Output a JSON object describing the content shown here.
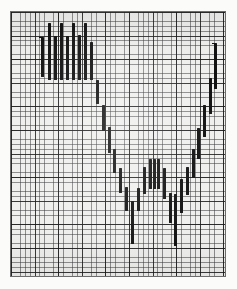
{
  "figure": {
    "kind": "graph-paper-bar-chart",
    "background_color": "#fbfbfa",
    "plot_background_color": "#efefee",
    "bar_color": "#111111",
    "grid_minor_color": "#3c3c3c",
    "grid_major_color": "#191919",
    "plot_left": 10,
    "plot_top": 11,
    "plot_width": 216,
    "plot_height": 266,
    "grid_minor_step_px": 4.72,
    "grid_major_step_px": 23.6,
    "grid_minor_cols": 45,
    "grid_minor_rows": 56
  },
  "chart_data": {
    "type": "bar",
    "title": "",
    "subtitle": "",
    "xlabel": "",
    "ylabel": "",
    "legend": [],
    "grid": true,
    "legend_position": "none",
    "orientation": "vertical",
    "note": "Vertical price bars (high-low range bars) on graph paper forming a V / U shaped pattern: a high plateau at left, a decline to a low trough in the centre, then a recovery back up to the right.",
    "x_unit": "bar index",
    "y_unit": "grid squares from bottom",
    "xlim": [
      0,
      45
    ],
    "ylim": [
      0,
      56
    ],
    "categories": [
      "1",
      "2",
      "3",
      "4",
      "5",
      "6",
      "7",
      "8",
      "9",
      "10",
      "11",
      "12",
      "13",
      "14",
      "15",
      "16",
      "17",
      "18",
      "19",
      "20",
      "21",
      "22",
      "23",
      "24",
      "25",
      "26",
      "27",
      "28",
      "29",
      "30",
      "31",
      "32",
      "33",
      "34",
      "35",
      "36"
    ],
    "bars": [
      {
        "index": 1,
        "x_px": 40,
        "top_px": 36,
        "bottom_px": 76,
        "high": 49,
        "low": 41
      },
      {
        "index": 2,
        "x_px": 47,
        "top_px": 22,
        "bottom_px": 79,
        "high": 52,
        "low": 40
      },
      {
        "index": 3,
        "x_px": 53,
        "top_px": 35,
        "bottom_px": 79,
        "high": 49,
        "low": 40
      },
      {
        "index": 4,
        "x_px": 59,
        "top_px": 22,
        "bottom_px": 79,
        "high": 52,
        "low": 40
      },
      {
        "index": 5,
        "x_px": 65,
        "top_px": 35,
        "bottom_px": 79,
        "high": 49,
        "low": 40
      },
      {
        "index": 6,
        "x_px": 71,
        "top_px": 22,
        "bottom_px": 79,
        "high": 52,
        "low": 40
      },
      {
        "index": 7,
        "x_px": 77,
        "top_px": 34,
        "bottom_px": 79,
        "high": 49,
        "low": 40
      },
      {
        "index": 8,
        "x_px": 83,
        "top_px": 22,
        "bottom_px": 79,
        "high": 52,
        "low": 40
      },
      {
        "index": 9,
        "x_px": 89,
        "top_px": 41,
        "bottom_px": 79,
        "high": 47,
        "low": 40
      },
      {
        "index": 10,
        "x_px": 95,
        "top_px": 79,
        "bottom_px": 103,
        "high": 40,
        "low": 35
      },
      {
        "index": 11,
        "x_px": 101,
        "top_px": 104,
        "bottom_px": 130,
        "high": 35,
        "low": 29
      },
      {
        "index": 12,
        "x_px": 107,
        "top_px": 126,
        "bottom_px": 152,
        "high": 30,
        "low": 25
      },
      {
        "index": 13,
        "x_px": 112,
        "top_px": 148,
        "bottom_px": 172,
        "high": 26,
        "low": 20
      },
      {
        "index": 14,
        "x_px": 118,
        "top_px": 167,
        "bottom_px": 192,
        "high": 22,
        "low": 17
      },
      {
        "index": 15,
        "x_px": 124,
        "top_px": 186,
        "bottom_px": 210,
        "high": 18,
        "low": 13
      },
      {
        "index": 16,
        "x_px": 130,
        "top_px": 200,
        "bottom_px": 243,
        "high": 15,
        "low": 6
      },
      {
        "index": 17,
        "x_px": 136,
        "top_px": 187,
        "bottom_px": 210,
        "high": 18,
        "low": 13
      },
      {
        "index": 18,
        "x_px": 142,
        "top_px": 166,
        "bottom_px": 193,
        "high": 22,
        "low": 16
      },
      {
        "index": 19,
        "x_px": 148,
        "top_px": 158,
        "bottom_px": 188,
        "high": 24,
        "low": 17
      },
      {
        "index": 20,
        "x_px": 152,
        "top_px": 158,
        "bottom_px": 188,
        "high": 24,
        "low": 17
      },
      {
        "index": 21,
        "x_px": 156,
        "top_px": 158,
        "bottom_px": 188,
        "high": 24,
        "low": 17
      },
      {
        "index": 22,
        "x_px": 162,
        "top_px": 167,
        "bottom_px": 198,
        "high": 22,
        "low": 15
      },
      {
        "index": 23,
        "x_px": 168,
        "top_px": 192,
        "bottom_px": 222,
        "high": 16,
        "low": 10
      },
      {
        "index": 24,
        "x_px": 173,
        "top_px": 193,
        "bottom_px": 245,
        "high": 16,
        "low": 5
      },
      {
        "index": 25,
        "x_px": 179,
        "top_px": 178,
        "bottom_px": 212,
        "high": 19,
        "low": 12
      },
      {
        "index": 26,
        "x_px": 185,
        "top_px": 166,
        "bottom_px": 194,
        "high": 22,
        "low": 16
      },
      {
        "index": 27,
        "x_px": 191,
        "top_px": 148,
        "bottom_px": 177,
        "high": 26,
        "low": 20
      },
      {
        "index": 28,
        "x_px": 196,
        "top_px": 127,
        "bottom_px": 158,
        "high": 30,
        "low": 24
      },
      {
        "index": 29,
        "x_px": 202,
        "top_px": 104,
        "bottom_px": 136,
        "high": 35,
        "low": 29
      },
      {
        "index": 30,
        "x_px": 208,
        "top_px": 77,
        "bottom_px": 113,
        "high": 41,
        "low": 33
      },
      {
        "index": 31,
        "x_px": 213,
        "top_px": 42,
        "bottom_px": 88,
        "high": 48,
        "low": 39
      }
    ],
    "annotations": [
      {
        "label": "left-peak-tick",
        "x_px": 40,
        "y_px": 36
      },
      {
        "label": "right-peak-tick",
        "x_px": 213,
        "y_px": 42
      }
    ]
  },
  "labels": {
    "plot_region": "graph-paper-plot-area"
  }
}
